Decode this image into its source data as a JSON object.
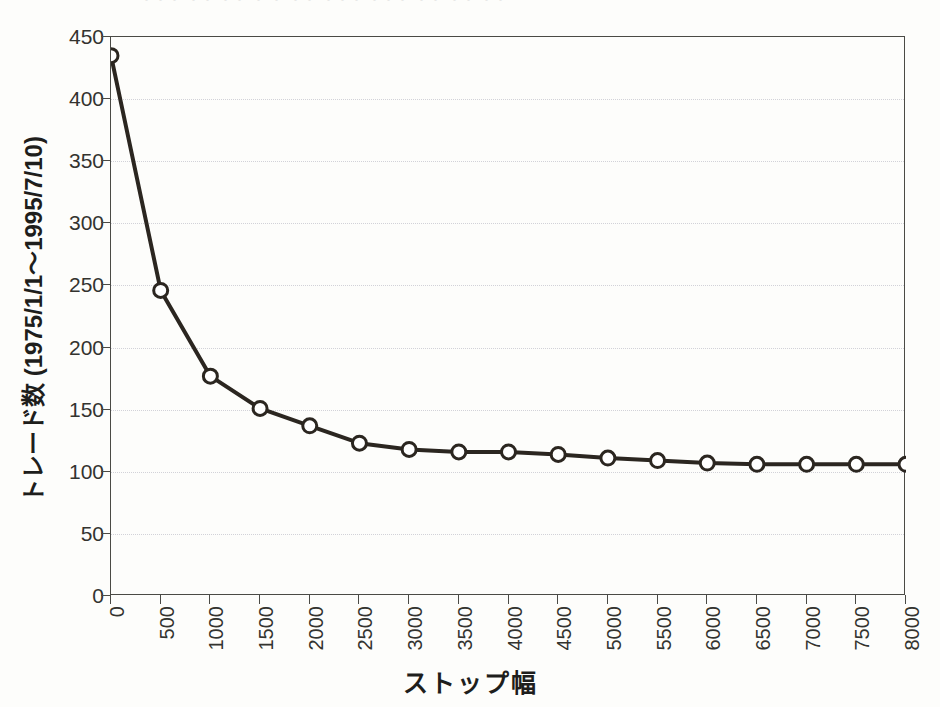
{
  "figure": {
    "top_caption_fragment": "・・・ ・・ ・・ ・ ・ ・・ ・・・  ・・・  ・・ ・・  ・・",
    "background_color": "#fdfdfb",
    "axis_color": "#4a4a45",
    "series_color": "#2b2620",
    "marker_fill": "#ffffff",
    "grid_color": "#d2d2d8"
  },
  "chart_data": {
    "type": "line",
    "title": "",
    "subtitle": "",
    "xlabel": "ストップ幅",
    "ylabel": "トレード数 (1975/1/1～1995/7/10)",
    "x": [
      0,
      500,
      1000,
      1500,
      2000,
      2500,
      3000,
      3500,
      4000,
      4500,
      5000,
      5500,
      6000,
      6500,
      7000,
      7500,
      8000
    ],
    "xtick_labels": [
      "0",
      "500",
      "1000",
      "1500",
      "2000",
      "2500",
      "3000",
      "3500",
      "4000",
      "4500",
      "5000",
      "5500",
      "6000",
      "6500",
      "7000",
      "7500",
      "8000"
    ],
    "values": [
      435,
      246,
      177,
      151,
      137,
      123,
      118,
      116,
      116,
      114,
      111,
      109,
      107,
      106,
      106,
      106,
      106
    ],
    "ytick_labels": [
      "0",
      "50",
      "100",
      "150",
      "200",
      "250",
      "300",
      "350",
      "400",
      "450"
    ],
    "yticks": [
      0,
      50,
      100,
      150,
      200,
      250,
      300,
      350,
      400,
      450
    ],
    "xlim": [
      0,
      8000
    ],
    "ylim": [
      0,
      450
    ],
    "grid": "horizontal-dotted",
    "legend": "none",
    "marker": "open-circle",
    "marker_size": 7,
    "line_width": 4
  }
}
